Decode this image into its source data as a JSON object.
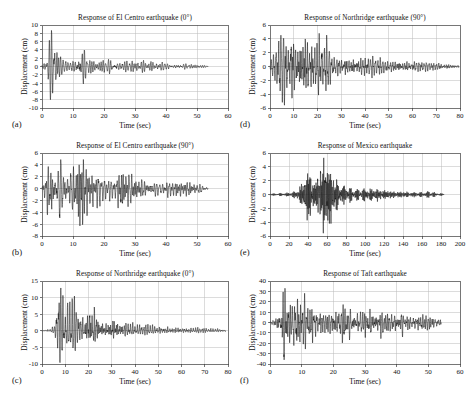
{
  "figure": {
    "background_color": "#ffffff",
    "trace_color": "#151515",
    "grid_color": "#b9b9b9",
    "frame_color": "#3c3c3c"
  },
  "chart_data": [
    {
      "id": "a",
      "tag": "(a)",
      "type": "line",
      "title": "Response of El Centro earthquake (0°)",
      "xlabel": "Time (sec)",
      "ylabel": "Displacement (cm)",
      "xlim": [
        0,
        60
      ],
      "ylim": [
        -10,
        10
      ],
      "xticks": [
        0,
        10,
        20,
        30,
        40,
        50,
        60
      ],
      "yticks": [
        10,
        8,
        6,
        4,
        2,
        0,
        -2,
        -4,
        -6,
        -8,
        -10
      ],
      "xtick_labels": [
        "0",
        "10",
        "20",
        "30",
        "40",
        "50",
        "60"
      ],
      "ytick_labels": [
        "10",
        "8",
        "6",
        "4",
        "2",
        "0",
        "-2",
        "-4",
        "-6",
        "-8",
        "-10"
      ],
      "grid": true,
      "legend": "none",
      "signal": {
        "kind": "seismic-accelerogram-displacement",
        "duration_sec": 53.5,
        "dominant_period_sec": 0.62,
        "peak_positive_cm": 8.7,
        "peak_negative_cm": -8.0,
        "peak_time_sec": 4.3,
        "envelope": [
          {
            "t": 0.0,
            "amp": 0.15
          },
          {
            "t": 1.2,
            "amp": 1.6
          },
          {
            "t": 2.4,
            "amp": 5.2
          },
          {
            "t": 3.6,
            "amp": 8.7
          },
          {
            "t": 4.8,
            "amp": 7.6
          },
          {
            "t": 6.0,
            "amp": 2.6
          },
          {
            "t": 8.0,
            "amp": 1.6
          },
          {
            "t": 10.5,
            "amp": 1.5
          },
          {
            "t": 12.4,
            "amp": 4.4
          },
          {
            "t": 13.6,
            "amp": 3.1
          },
          {
            "t": 16.0,
            "amp": 1.5
          },
          {
            "t": 20.0,
            "amp": 1.5
          },
          {
            "t": 24.0,
            "amp": 1.7
          },
          {
            "t": 28.0,
            "amp": 1.5
          },
          {
            "t": 32.0,
            "amp": 1.3
          },
          {
            "t": 36.0,
            "amp": 1.2
          },
          {
            "t": 40.0,
            "amp": 1.0
          },
          {
            "t": 45.0,
            "amp": 0.7
          },
          {
            "t": 50.0,
            "amp": 0.5
          },
          {
            "t": 53.5,
            "amp": 0.25
          }
        ],
        "seed": 1301
      }
    },
    {
      "id": "b",
      "tag": "(b)",
      "type": "line",
      "title": "Response of El Centro earthquake (90°)",
      "xlabel": "Time (sec)",
      "ylabel": "Displacement (cm)",
      "xlim": [
        0,
        60
      ],
      "ylim": [
        -8,
        6
      ],
      "xticks": [
        0,
        10,
        20,
        30,
        40,
        50,
        60
      ],
      "yticks": [
        6,
        4,
        2,
        0,
        -2,
        -4,
        -6,
        -8
      ],
      "xtick_labels": [
        "0",
        "10",
        "20",
        "30",
        "40",
        "50",
        "60"
      ],
      "ytick_labels": [
        "6",
        "4",
        "2",
        "0",
        "-2",
        "-4",
        "-6",
        "-8"
      ],
      "grid": true,
      "legend": "none",
      "signal": {
        "kind": "seismic-accelerogram-displacement",
        "duration_sec": 53.5,
        "dominant_period_sec": 0.66,
        "peak_positive_cm": 4.9,
        "peak_negative_cm": -6.3,
        "peak_time_sec": 12.3,
        "envelope": [
          {
            "t": 0.0,
            "amp": 0.2
          },
          {
            "t": 1.0,
            "amp": 1.4
          },
          {
            "t": 2.2,
            "amp": 3.8
          },
          {
            "t": 3.4,
            "amp": 3.3
          },
          {
            "t": 4.6,
            "amp": 2.6
          },
          {
            "t": 6.0,
            "amp": 3.9
          },
          {
            "t": 7.5,
            "amp": 2.5
          },
          {
            "t": 9.0,
            "amp": 2.1
          },
          {
            "t": 11.0,
            "amp": 2.4
          },
          {
            "t": 12.3,
            "amp": 6.3
          },
          {
            "t": 13.5,
            "amp": 3.4
          },
          {
            "t": 15.0,
            "amp": 2.1
          },
          {
            "t": 18.0,
            "amp": 1.9
          },
          {
            "t": 21.0,
            "amp": 1.8
          },
          {
            "t": 24.0,
            "amp": 1.6
          },
          {
            "t": 25.8,
            "amp": 3.0
          },
          {
            "t": 27.5,
            "amp": 1.7
          },
          {
            "t": 31.0,
            "amp": 1.1
          },
          {
            "t": 36.0,
            "amp": 0.95
          },
          {
            "t": 42.0,
            "amp": 0.85
          },
          {
            "t": 48.0,
            "amp": 0.8
          },
          {
            "t": 53.5,
            "amp": 0.3
          }
        ],
        "seed": 2207
      }
    },
    {
      "id": "c",
      "tag": "(c)",
      "type": "line",
      "title": "Response of Northridge earthquake (0°)",
      "xlabel": "Time (sec)",
      "ylabel": "Displacement (cm)",
      "xlim": [
        0,
        80
      ],
      "ylim": [
        -10,
        15
      ],
      "xticks": [
        0,
        10,
        20,
        30,
        40,
        50,
        60,
        70,
        80
      ],
      "yticks": [
        15,
        10,
        5,
        0,
        -5,
        -10
      ],
      "xtick_labels": [
        "0",
        "10",
        "20",
        "30",
        "40",
        "50",
        "60",
        "70",
        "80"
      ],
      "ytick_labels": [
        "15",
        "10",
        "5",
        "0",
        "-5",
        "-10"
      ],
      "grid": true,
      "legend": "none",
      "signal": {
        "kind": "seismic-accelerogram-displacement",
        "duration_sec": 79.0,
        "dominant_period_sec": 0.78,
        "peak_positive_cm": 12.9,
        "peak_negative_cm": -9.6,
        "peak_time_sec": 7.6,
        "envelope": [
          {
            "t": 0.0,
            "amp": 0.1
          },
          {
            "t": 3.0,
            "amp": 0.45
          },
          {
            "t": 5.5,
            "amp": 1.1
          },
          {
            "t": 7.0,
            "amp": 9.0
          },
          {
            "t": 7.6,
            "amp": 12.9
          },
          {
            "t": 8.5,
            "amp": 9.6
          },
          {
            "t": 10.0,
            "amp": 5.0
          },
          {
            "t": 11.5,
            "amp": 8.0
          },
          {
            "t": 13.0,
            "amp": 9.4
          },
          {
            "t": 14.5,
            "amp": 7.0
          },
          {
            "t": 16.0,
            "amp": 4.4
          },
          {
            "t": 18.0,
            "amp": 3.4
          },
          {
            "t": 20.0,
            "amp": 6.6
          },
          {
            "t": 22.0,
            "amp": 7.2
          },
          {
            "t": 23.5,
            "amp": 6.0
          },
          {
            "t": 25.0,
            "amp": 3.0
          },
          {
            "t": 28.0,
            "amp": 2.6
          },
          {
            "t": 30.5,
            "amp": 4.6
          },
          {
            "t": 33.0,
            "amp": 2.6
          },
          {
            "t": 37.0,
            "amp": 2.3
          },
          {
            "t": 42.0,
            "amp": 1.5
          },
          {
            "t": 48.0,
            "amp": 1.3
          },
          {
            "t": 55.0,
            "amp": 1.0
          },
          {
            "t": 65.0,
            "amp": 0.8
          },
          {
            "t": 75.0,
            "amp": 0.6
          },
          {
            "t": 79.0,
            "amp": 0.4
          }
        ],
        "seed": 3313
      }
    },
    {
      "id": "d",
      "tag": "(d)",
      "type": "line",
      "title": "Response of Northridge earthquake (90°)",
      "xlabel": "Time (sec)",
      "ylabel": "Displacement (cm)",
      "xlim": [
        0,
        80
      ],
      "ylim": [
        -6,
        6
      ],
      "xticks": [
        0,
        10,
        20,
        30,
        40,
        50,
        60,
        70,
        80
      ],
      "yticks": [
        6,
        4,
        2,
        0,
        -2,
        -4,
        -6
      ],
      "xtick_labels": [
        "0",
        "10",
        "20",
        "30",
        "40",
        "50",
        "60",
        "70",
        "80"
      ],
      "ytick_labels": [
        "6",
        "4",
        "2",
        "0",
        "-2",
        "-4",
        "-6"
      ],
      "grid": true,
      "legend": "none",
      "signal": {
        "kind": "seismic-accelerogram-displacement",
        "duration_sec": 79.5,
        "dominant_period_sec": 0.72,
        "peak_positive_cm": 4.8,
        "peak_negative_cm": -5.6,
        "peak_time_sec": 14.8,
        "envelope": [
          {
            "t": 0.0,
            "amp": 0.6
          },
          {
            "t": 1.5,
            "amp": 1.6
          },
          {
            "t": 3.0,
            "amp": 2.7
          },
          {
            "t": 4.5,
            "amp": 5.5
          },
          {
            "t": 6.0,
            "amp": 4.4
          },
          {
            "t": 7.5,
            "amp": 3.3
          },
          {
            "t": 9.0,
            "amp": 4.5
          },
          {
            "t": 10.5,
            "amp": 3.6
          },
          {
            "t": 12.0,
            "amp": 3.2
          },
          {
            "t": 13.5,
            "amp": 4.3
          },
          {
            "t": 14.8,
            "amp": 5.6
          },
          {
            "t": 16.0,
            "amp": 4.3
          },
          {
            "t": 18.0,
            "amp": 3.4
          },
          {
            "t": 20.0,
            "amp": 3.8
          },
          {
            "t": 22.0,
            "amp": 3.3
          },
          {
            "t": 24.0,
            "amp": 3.4
          },
          {
            "t": 26.0,
            "amp": 1.5
          },
          {
            "t": 29.0,
            "amp": 1.1
          },
          {
            "t": 32.0,
            "amp": 1.3
          },
          {
            "t": 36.0,
            "amp": 1.2
          },
          {
            "t": 40.0,
            "amp": 1.4
          },
          {
            "t": 44.0,
            "amp": 1.3
          },
          {
            "t": 48.0,
            "amp": 0.9
          },
          {
            "t": 54.0,
            "amp": 0.8
          },
          {
            "t": 60.0,
            "amp": 0.7
          },
          {
            "t": 68.0,
            "amp": 0.55
          },
          {
            "t": 75.0,
            "amp": 0.4
          },
          {
            "t": 79.5,
            "amp": 0.2
          }
        ],
        "seed": 4421
      }
    },
    {
      "id": "e",
      "tag": "(e)",
      "type": "line",
      "title": "Response of Mexico earthquake",
      "xlabel": "Time (sec)",
      "ylabel": "Displacement (cm)",
      "xlim": [
        0,
        200
      ],
      "ylim": [
        -6,
        6
      ],
      "xticks": [
        0,
        20,
        40,
        60,
        80,
        100,
        120,
        140,
        160,
        180,
        200
      ],
      "yticks": [
        6,
        4,
        2,
        0,
        -2,
        -4,
        -6
      ],
      "xtick_labels": [
        "0",
        "20",
        "40",
        "60",
        "80",
        "100",
        "120",
        "140",
        "160",
        "180",
        "200"
      ],
      "ytick_labels": [
        "6",
        "4",
        "2",
        "0",
        "-2",
        "-4",
        "-6"
      ],
      "grid": true,
      "legend": "none",
      "signal": {
        "kind": "seismic-accelerogram-displacement",
        "duration_sec": 183.0,
        "dominant_period_sec": 1.05,
        "peak_positive_cm": 5.3,
        "peak_negative_cm": -5.6,
        "peak_time_sec": 59.0,
        "envelope": [
          {
            "t": 0.0,
            "amp": 0.12
          },
          {
            "t": 10.0,
            "amp": 0.18
          },
          {
            "t": 20.0,
            "amp": 0.25
          },
          {
            "t": 28.0,
            "amp": 0.5
          },
          {
            "t": 34.0,
            "amp": 1.6
          },
          {
            "t": 38.0,
            "amp": 2.4
          },
          {
            "t": 41.0,
            "amp": 3.6
          },
          {
            "t": 44.0,
            "amp": 2.2
          },
          {
            "t": 47.0,
            "amp": 1.5
          },
          {
            "t": 50.0,
            "amp": 2.6
          },
          {
            "t": 53.0,
            "amp": 3.4
          },
          {
            "t": 56.0,
            "amp": 4.4
          },
          {
            "t": 59.0,
            "amp": 5.6
          },
          {
            "t": 62.0,
            "amp": 4.2
          },
          {
            "t": 65.0,
            "amp": 3.0
          },
          {
            "t": 68.0,
            "amp": 2.2
          },
          {
            "t": 72.0,
            "amp": 1.6
          },
          {
            "t": 78.0,
            "amp": 1.2
          },
          {
            "t": 85.0,
            "amp": 0.9
          },
          {
            "t": 95.0,
            "amp": 0.75
          },
          {
            "t": 105.0,
            "amp": 0.85
          },
          {
            "t": 115.0,
            "amp": 0.7
          },
          {
            "t": 125.0,
            "amp": 0.5
          },
          {
            "t": 140.0,
            "amp": 0.38
          },
          {
            "t": 155.0,
            "amp": 0.3
          },
          {
            "t": 168.0,
            "amp": 0.45
          },
          {
            "t": 175.0,
            "amp": 0.25
          },
          {
            "t": 183.0,
            "amp": 0.12
          }
        ],
        "seed": 5507
      }
    },
    {
      "id": "f",
      "tag": "(f)",
      "type": "line",
      "title": "Response of Taft earthquake",
      "xlabel": "Time (sec)",
      "ylabel": "Displacement (cm)",
      "xlim": [
        0,
        60
      ],
      "ylim": [
        -40,
        40
      ],
      "xticks": [
        0,
        10,
        20,
        30,
        40,
        50,
        60
      ],
      "yticks": [
        40,
        30,
        20,
        10,
        0,
        -10,
        -20,
        -30,
        -40
      ],
      "xtick_labels": [
        "0",
        "10",
        "20",
        "30",
        "40",
        "50",
        "60"
      ],
      "ytick_labels": [
        "40",
        "30",
        "20",
        "10",
        "0",
        "-10",
        "-20",
        "-30",
        "-40"
      ],
      "grid": true,
      "legend": "none",
      "signal": {
        "kind": "seismic-accelerogram-displacement",
        "duration_sec": 54.0,
        "dominant_period_sec": 0.58,
        "peak_positive_cm": 33.0,
        "peak_negative_cm": -36.0,
        "peak_time_sec": 4.6,
        "envelope": [
          {
            "t": 0.0,
            "amp": 1.0
          },
          {
            "t": 1.5,
            "amp": 4.0
          },
          {
            "t": 3.0,
            "amp": 14.0
          },
          {
            "t": 4.6,
            "amp": 36.0
          },
          {
            "t": 6.0,
            "amp": 22.0
          },
          {
            "t": 7.5,
            "amp": 26.0
          },
          {
            "t": 9.0,
            "amp": 31.0
          },
          {
            "t": 10.5,
            "amp": 25.0
          },
          {
            "t": 12.0,
            "amp": 21.0
          },
          {
            "t": 13.5,
            "amp": 20.0
          },
          {
            "t": 15.0,
            "amp": 13.0
          },
          {
            "t": 17.0,
            "amp": 10.0
          },
          {
            "t": 19.0,
            "amp": 12.0
          },
          {
            "t": 21.0,
            "amp": 13.0
          },
          {
            "t": 23.5,
            "amp": 21.0
          },
          {
            "t": 25.0,
            "amp": 14.0
          },
          {
            "t": 27.0,
            "amp": 10.0
          },
          {
            "t": 29.0,
            "amp": 12.0
          },
          {
            "t": 31.0,
            "amp": 13.0
          },
          {
            "t": 33.0,
            "amp": 11.0
          },
          {
            "t": 35.0,
            "amp": 12.0
          },
          {
            "t": 38.0,
            "amp": 10.0
          },
          {
            "t": 41.0,
            "amp": 11.0
          },
          {
            "t": 44.0,
            "amp": 7.0
          },
          {
            "t": 47.0,
            "amp": 8.0
          },
          {
            "t": 50.0,
            "amp": 8.5
          },
          {
            "t": 52.0,
            "amp": 6.0
          },
          {
            "t": 54.0,
            "amp": 3.0
          }
        ],
        "seed": 6619
      }
    }
  ],
  "layout": {
    "columns": 2,
    "rows": 3,
    "panel_order": [
      "a",
      "b",
      "c",
      "d",
      "e",
      "f"
    ],
    "panel_boxes": [
      {
        "id": "a",
        "left": 12,
        "top": 14,
        "width": 224,
        "height": 118
      },
      {
        "id": "b",
        "left": 12,
        "top": 142,
        "width": 224,
        "height": 118
      },
      {
        "id": "c",
        "left": 12,
        "top": 270,
        "width": 224,
        "height": 118
      },
      {
        "id": "d",
        "left": 240,
        "top": 14,
        "width": 228,
        "height": 118
      },
      {
        "id": "e",
        "left": 240,
        "top": 142,
        "width": 228,
        "height": 118
      },
      {
        "id": "f",
        "left": 240,
        "top": 270,
        "width": 228,
        "height": 118
      }
    ]
  }
}
